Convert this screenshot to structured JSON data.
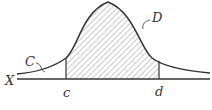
{
  "diagram": {
    "type": "normal-distribution-curve",
    "labels": {
      "axis": "X",
      "curve": "C",
      "shaded_region": "D",
      "left_bound": "c",
      "right_bound": "d"
    },
    "colors": {
      "stroke": "#333333",
      "hatch": "#555555",
      "background": "#ffffff"
    }
  }
}
